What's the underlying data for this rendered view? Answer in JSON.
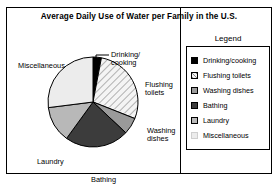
{
  "chart_data": {
    "type": "pie",
    "title": "Average Daily Use of Water per Family in the U.S.",
    "xlabel": "",
    "ylabel": "",
    "legend_position": "right",
    "grid": false,
    "start_angle_deg": 0,
    "direction": "clockwise",
    "categories": [
      "Drinking/cooking",
      "Flushing toilets",
      "Washing dishes",
      "Bathing",
      "Laundry",
      "Miscellaneous"
    ],
    "values": [
      3,
      28,
      6,
      23,
      13,
      27
    ],
    "slices": [
      {
        "label": "Drinking/cooking",
        "value": 3,
        "fill": "solid-black",
        "color": "#000000"
      },
      {
        "label": "Flushing toilets",
        "value": 28,
        "fill": "diagonal-hatch",
        "color": "#f2f2f2"
      },
      {
        "label": "Washing dishes",
        "value": 6,
        "fill": "solid-midgray",
        "color": "#9a9a9a"
      },
      {
        "label": "Bathing",
        "value": 23,
        "fill": "solid-darkgray",
        "color": "#3c3c3c"
      },
      {
        "label": "Laundry",
        "value": 13,
        "fill": "solid-lightmid",
        "color": "#b8b8b8"
      },
      {
        "label": "Miscellaneous",
        "value": 27,
        "fill": "solid-verylight",
        "color": "#ececec"
      }
    ]
  },
  "callouts": {
    "miscellaneous": "Miscellaneous",
    "drinking_line1": "Drinking/",
    "drinking_line2": "cooking",
    "flushing_line1": "Flushing",
    "flushing_line2": "toilets",
    "washing_line1": "Washing",
    "washing_line2": "dishes",
    "bathing": "Bathing",
    "laundry": "Laundry"
  },
  "legend": {
    "title": "Legend",
    "items": [
      {
        "label": "Drinking/cooking"
      },
      {
        "label": "Flushing toilets"
      },
      {
        "label": "Washing dishes"
      },
      {
        "label": "Bathing"
      },
      {
        "label": "Laundry"
      },
      {
        "label": "Miscellaneous"
      }
    ]
  }
}
